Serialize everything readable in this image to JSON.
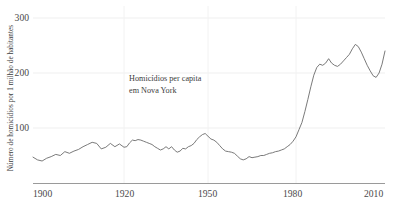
{
  "chart_data": {
    "type": "line",
    "title": "",
    "subtitle": "",
    "annotation_line1": "Homicídios per capita",
    "annotation_line2": "em Nova York",
    "xlabel": "",
    "ylabel": "Número de homicídios por 1 milhão de habitantes",
    "xlim": [
      1900,
      2010
    ],
    "ylim": [
      0,
      320
    ],
    "xticks": [
      1900,
      1920,
      1950,
      1980,
      2010
    ],
    "xtick_labels": [
      "1900",
      "1920",
      "1950",
      "1980",
      "2010"
    ],
    "yticks": [
      100,
      200,
      300
    ],
    "ytick_labels": [
      "100",
      "200",
      "300"
    ],
    "grid": "horizontal-and-vertical-light",
    "legend": "none",
    "line_color": "#6b6b6b",
    "grid_color": "#efefef",
    "axis_color": "#9a9a9a",
    "series": [
      {
        "name": "Homicídios per capita em Nova York",
        "x": [
          1900,
          1901,
          1902,
          1903,
          1904,
          1905,
          1906,
          1907,
          1908,
          1909,
          1910,
          1911,
          1912,
          1913,
          1914,
          1915,
          1916,
          1917,
          1918,
          1919,
          1920,
          1921,
          1922,
          1923,
          1924,
          1925,
          1926,
          1927,
          1928,
          1929,
          1930,
          1931,
          1932,
          1933,
          1934,
          1935,
          1936,
          1937,
          1938,
          1939,
          1940,
          1941,
          1942,
          1943,
          1944,
          1945,
          1946,
          1947,
          1948,
          1949,
          1950,
          1951,
          1952,
          1953,
          1954,
          1955,
          1956,
          1957,
          1958,
          1959,
          1960,
          1961,
          1962,
          1963,
          1964,
          1965,
          1966,
          1967,
          1968,
          1969,
          1970,
          1971,
          1972,
          1973,
          1974,
          1975,
          1976,
          1977,
          1978,
          1979,
          1980,
          1981,
          1982,
          1983,
          1984,
          1985,
          1986,
          1987,
          1988,
          1989,
          1990,
          1991,
          1992,
          1993,
          1994,
          1995,
          1996,
          1997,
          1998,
          1999,
          2000,
          2001,
          2002,
          2003,
          2004,
          2005,
          2006,
          2007,
          2008,
          2009,
          2010
        ],
        "values": [
          47,
          42,
          40,
          45,
          48,
          52,
          50,
          57,
          54,
          58,
          61,
          66,
          70,
          74,
          72,
          62,
          65,
          72,
          66,
          71,
          65,
          66,
          73,
          78,
          77,
          79,
          78,
          76,
          74,
          72,
          70,
          66,
          63,
          60,
          62,
          66,
          62,
          66,
          60,
          56,
          58,
          63,
          62,
          66,
          68,
          72,
          79,
          84,
          88,
          90,
          85,
          80,
          78,
          74,
          68,
          62,
          58,
          57,
          56,
          54,
          49,
          44,
          42,
          44,
          48,
          46,
          47,
          48,
          50,
          50,
          52,
          54,
          55,
          57,
          58,
          60,
          62,
          66,
          70,
          76,
          84,
          97,
          110,
          130,
          152,
          175,
          196,
          210,
          216,
          214,
          218,
          226,
          218,
          214,
          212,
          216,
          222,
          228,
          234,
          244,
          252,
          248,
          238,
          226,
          214,
          204,
          195,
          192,
          200,
          216,
          240
        ]
      },
      {
        "name": "series-tail-extension",
        "note": "continuation of same single series beyond 2010 index mapping",
        "x": [],
        "values": []
      }
    ],
    "data_points_note": "Single continuous line; x positions are spaced by tick label ordering 1900/1920/1950/1980/2010."
  },
  "axis": {
    "ytick_300": "300",
    "ytick_200": "200",
    "ytick_100": "100",
    "xtick_1900": "1900",
    "xtick_1920": "1920",
    "xtick_1950": "1950",
    "xtick_1980": "1980",
    "xtick_2010": "2010"
  },
  "labels": {
    "ylabel": "Número de homicídios por 1 milhão de habitantes",
    "annotation_line1": "Homicídios per capita",
    "annotation_line2": "em Nova York"
  },
  "colors": {
    "line": "#6b6b6b",
    "grid": "#efefef",
    "axis": "#9a9a9a",
    "text": "#3c3c3c",
    "background": "#ffffff"
  }
}
